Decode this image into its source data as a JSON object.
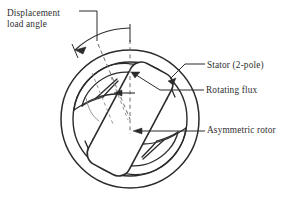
{
  "figure": {
    "kind": "engineering-cross-section-diagram",
    "background_color": "#ffffff",
    "line_color": "#2b2b2b",
    "text_color": "#2f2f2f"
  },
  "labels": {
    "displacement_line1": "Displacement",
    "displacement_line2": "load angle",
    "stator": "Stator (2-pole)",
    "rotating_flux": "Rotating flux",
    "asymmetric_rotor": "Asymmetric rotor"
  },
  "parts": {
    "stator_outer_circle": "stator-outer-circle",
    "stator_bore_circle": "stator-bore-circle",
    "rotor_body": "asymmetric-rotor-body",
    "flux_lobe_top": "flux-lobe-top",
    "flux_lobe_bottom": "flux-lobe-bottom",
    "vertical_reference_axis": "vertical-reference-axis",
    "rotor_axis": "rotor-tilt-axis",
    "angle_arc": "displacement-load-angle-arc"
  },
  "geometry": {
    "center_x": 130,
    "center_y": 119,
    "stator_outer_radius": 69,
    "stator_bore_radius": 57,
    "rotor_tilt_degrees": 28
  }
}
